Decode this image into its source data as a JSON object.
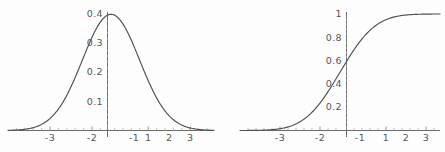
{
  "figure": {
    "background_color": "#fdfdfd",
    "curve_color": "#4f4f4f",
    "axis_color": "#5a5a5a",
    "label_color": "#565656"
  },
  "chart_data": [
    {
      "type": "line",
      "name": "standard-normal-pdf",
      "title": "",
      "xlabel": "",
      "ylabel": "",
      "xlim": [
        -3.6,
        3.6
      ],
      "ylim": [
        0,
        0.42
      ],
      "grid": false,
      "legend": null,
      "axes_style": "crossed-at-origin",
      "xticks": [
        -3,
        -2,
        -1,
        1,
        2,
        3
      ],
      "xtick_labels": [
        "-3",
        "-2",
        "-1",
        "1",
        "2",
        "3"
      ],
      "yticks": [
        0.1,
        0.2,
        0.3,
        0.4
      ],
      "ytick_labels": [
        "0.1",
        "0.2",
        "0.3",
        "0.4"
      ],
      "x": [
        -3.6,
        -3.4,
        -3.2,
        -3.0,
        -2.8,
        -2.6,
        -2.4,
        -2.2,
        -2.0,
        -1.8,
        -1.6,
        -1.4,
        -1.2,
        -1.0,
        -0.8,
        -0.6,
        -0.4,
        -0.2,
        0.0,
        0.2,
        0.4,
        0.6,
        0.8,
        1.0,
        1.2,
        1.4,
        1.6,
        1.8,
        2.0,
        2.2,
        2.4,
        2.6,
        2.8,
        3.0,
        3.2,
        3.4,
        3.6
      ],
      "y": [
        0.0006,
        0.0012,
        0.0024,
        0.0044,
        0.0079,
        0.0136,
        0.0224,
        0.0355,
        0.054,
        0.079,
        0.1109,
        0.1497,
        0.1942,
        0.242,
        0.2897,
        0.3332,
        0.3683,
        0.391,
        0.3989,
        0.391,
        0.3683,
        0.3332,
        0.2897,
        0.242,
        0.1942,
        0.1497,
        0.1109,
        0.079,
        0.054,
        0.0355,
        0.0224,
        0.0136,
        0.0079,
        0.0044,
        0.0024,
        0.0012,
        0.0006
      ],
      "peak_value": 0.3989,
      "peak_x": 0
    },
    {
      "type": "line",
      "name": "standard-normal-cdf",
      "title": "",
      "xlabel": "",
      "ylabel": "",
      "xlim": [
        -3.6,
        3.6
      ],
      "ylim": [
        0,
        1.05
      ],
      "grid": false,
      "legend": null,
      "axes_style": "crossed-at-origin",
      "xticks": [
        -3,
        -2,
        -1,
        1,
        2,
        3
      ],
      "xtick_labels": [
        "-3",
        "-2",
        "-1",
        "1",
        "2",
        "3"
      ],
      "yticks": [
        0.2,
        0.4,
        0.6,
        0.8,
        1.0
      ],
      "ytick_labels": [
        "0.2",
        "0.4",
        "0.6",
        "0.8",
        "1"
      ],
      "x": [
        -3.6,
        -3.4,
        -3.2,
        -3.0,
        -2.8,
        -2.6,
        -2.4,
        -2.2,
        -2.0,
        -1.8,
        -1.6,
        -1.4,
        -1.2,
        -1.0,
        -0.8,
        -0.6,
        -0.4,
        -0.2,
        0.0,
        0.2,
        0.4,
        0.6,
        0.8,
        1.0,
        1.2,
        1.4,
        1.6,
        1.8,
        2.0,
        2.2,
        2.4,
        2.6,
        2.8,
        3.0,
        3.2,
        3.4,
        3.6
      ],
      "y": [
        0.0002,
        0.0003,
        0.0007,
        0.0013,
        0.0026,
        0.0047,
        0.0082,
        0.0139,
        0.0228,
        0.0359,
        0.0548,
        0.0808,
        0.1151,
        0.1587,
        0.2119,
        0.2743,
        0.3446,
        0.4207,
        0.5,
        0.5793,
        0.6554,
        0.7257,
        0.7881,
        0.8413,
        0.8849,
        0.9192,
        0.9452,
        0.9641,
        0.9772,
        0.9861,
        0.9918,
        0.9953,
        0.9974,
        0.9987,
        0.9993,
        0.9997,
        0.9998
      ],
      "value_at_zero": 0.5
    }
  ]
}
